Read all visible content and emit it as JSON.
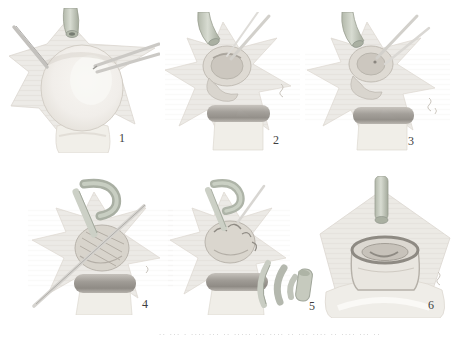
{
  "figure": {
    "panels": [
      {
        "id": "step-1",
        "number": "1"
      },
      {
        "id": "step-2",
        "number": "2"
      },
      {
        "id": "step-3",
        "number": "3"
      },
      {
        "id": "step-4",
        "number": "4"
      },
      {
        "id": "step-5",
        "number": "5"
      },
      {
        "id": "step-6",
        "number": "6"
      }
    ],
    "caption": {
      "text": "·· ··· · ···· ··· ·· ····· ··· ···· ·· ··· ···· ·· ···· ··· ··",
      "legible": false
    }
  }
}
